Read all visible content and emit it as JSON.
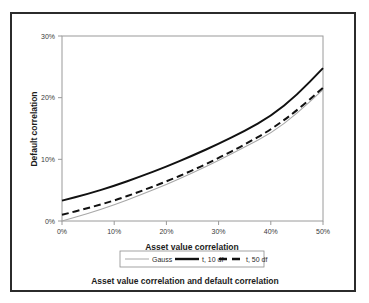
{
  "figure": {
    "caption": "Asset value correlation and default correlation"
  },
  "chart_data": {
    "type": "line",
    "title": "",
    "xlabel": "Asset value correlation",
    "ylabel": "Default correlation",
    "xlim": [
      0,
      50
    ],
    "ylim": [
      0,
      30
    ],
    "xticks": [
      0,
      10,
      20,
      30,
      40,
      50
    ],
    "xtick_labels": [
      "0%",
      "10%",
      "20%",
      "30%",
      "40%",
      "50%"
    ],
    "yticks": [
      0,
      10,
      20,
      30
    ],
    "ytick_labels": [
      "0%",
      "10%",
      "20%",
      "30%"
    ],
    "grid": false,
    "legend_position": "below-axis",
    "x": [
      0,
      5,
      10,
      15,
      20,
      25,
      30,
      35,
      40,
      45,
      50
    ],
    "series": [
      {
        "name": "Gauss",
        "style": "solid-thin",
        "color": "#a8a8a8",
        "values": [
          0.0,
          1.2,
          2.6,
          4.2,
          5.9,
          7.8,
          9.8,
          12.0,
          14.2,
          17.4,
          21.3
        ]
      },
      {
        "name": "t, 10 df",
        "style": "solid-thick",
        "color": "#111111",
        "values": [
          3.3,
          4.4,
          5.7,
          7.2,
          8.8,
          10.6,
          12.5,
          14.6,
          17.0,
          20.4,
          24.8
        ]
      },
      {
        "name": "t, 50 df",
        "style": "dashed-thick",
        "color": "#111111",
        "values": [
          1.0,
          2.1,
          3.3,
          4.8,
          6.4,
          8.2,
          10.2,
          12.4,
          14.8,
          17.9,
          21.6
        ]
      }
    ]
  },
  "legend": {
    "items": [
      {
        "label": "Gauss"
      },
      {
        "label": "t, 10 df"
      },
      {
        "label": "t, 50 df"
      }
    ]
  }
}
